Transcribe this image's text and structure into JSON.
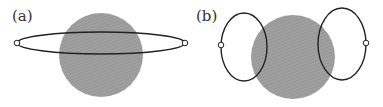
{
  "panels": [
    {
      "label": "(a)",
      "disc": {
        "cx": 101,
        "cy": 55,
        "r": 42,
        "fill": "#9a9a9a"
      },
      "loops": [
        {
          "cx": 101,
          "cy": 43,
          "rx": 84,
          "ry": 11
        }
      ],
      "markers": [
        {
          "cx": 17,
          "cy": 43
        },
        {
          "cx": 185,
          "cy": 43
        }
      ]
    },
    {
      "label": "(b)",
      "disc": {
        "cx": 293,
        "cy": 57,
        "r": 42,
        "fill": "#9a9a9a"
      },
      "loops": [
        {
          "cx": 244,
          "cy": 47,
          "rx": 23,
          "ry": 34
        },
        {
          "cx": 342,
          "cy": 44,
          "rx": 24,
          "ry": 36
        }
      ],
      "markers": [
        {
          "cx": 221,
          "cy": 45
        },
        {
          "cx": 366,
          "cy": 43
        }
      ]
    }
  ],
  "colors": {
    "disc": "#9a9a9a",
    "stroke": "#222222",
    "marker_fill": "#ffffff"
  }
}
